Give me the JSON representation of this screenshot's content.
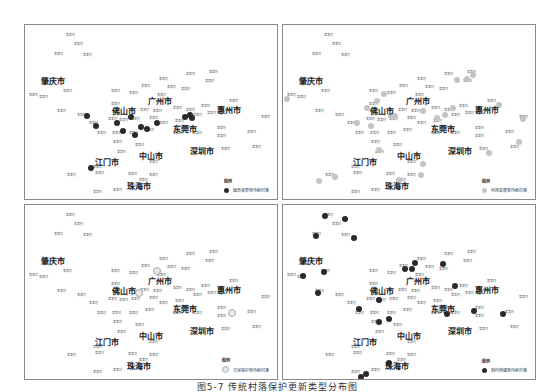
{
  "caption": "图5-7 传统村落保护更新类型分布图",
  "cities": [
    {
      "name": "肇庆市",
      "x": 28,
      "y": 55
    },
    {
      "name": "广州市",
      "x": 135,
      "y": 75
    },
    {
      "name": "佛山市",
      "x": 99,
      "y": 85
    },
    {
      "name": "惠州市",
      "x": 204,
      "y": 84
    },
    {
      "name": "东莞市",
      "x": 160,
      "y": 103
    },
    {
      "name": "深圳市",
      "x": 177,
      "y": 125
    },
    {
      "name": "中山市",
      "x": 126,
      "y": 130
    },
    {
      "name": "江门市",
      "x": 82,
      "y": 136
    },
    {
      "name": "珠海市",
      "x": 114,
      "y": 160
    }
  ],
  "villages": [
    {
      "name": "某某村",
      "x": 45,
      "y": 10
    },
    {
      "name": "某某村",
      "x": 53,
      "y": 19
    },
    {
      "name": "某某村",
      "x": 33,
      "y": 29
    },
    {
      "name": "某某村",
      "x": 62,
      "y": 30
    },
    {
      "name": "某某村",
      "x": 8,
      "y": 70
    },
    {
      "name": "某某村",
      "x": 18,
      "y": 72
    },
    {
      "name": "某某村",
      "x": 42,
      "y": 66
    },
    {
      "name": "某某村",
      "x": 90,
      "y": 66
    },
    {
      "name": "某某村",
      "x": 108,
      "y": 68
    },
    {
      "name": "某某村",
      "x": 120,
      "y": 61
    },
    {
      "name": "某某村",
      "x": 138,
      "y": 54
    },
    {
      "name": "某某村",
      "x": 146,
      "y": 62
    },
    {
      "name": "某某村",
      "x": 160,
      "y": 64
    },
    {
      "name": "某某村",
      "x": 165,
      "y": 49
    },
    {
      "name": "某某村",
      "x": 188,
      "y": 47
    },
    {
      "name": "某某村",
      "x": 184,
      "y": 56
    },
    {
      "name": "某某村",
      "x": 136,
      "y": 70
    },
    {
      "name": "某某村",
      "x": 90,
      "y": 79
    },
    {
      "name": "某某村",
      "x": 36,
      "y": 86
    },
    {
      "name": "某某村",
      "x": 56,
      "y": 90
    },
    {
      "name": "某某村",
      "x": 119,
      "y": 85
    },
    {
      "name": "某某村",
      "x": 132,
      "y": 86
    },
    {
      "name": "某某村",
      "x": 152,
      "y": 83
    },
    {
      "name": "某某村",
      "x": 165,
      "y": 85
    },
    {
      "name": "某某村",
      "x": 172,
      "y": 90
    },
    {
      "name": "某某村",
      "x": 180,
      "y": 81
    },
    {
      "name": "某某村",
      "x": 186,
      "y": 88
    },
    {
      "name": "某某村",
      "x": 208,
      "y": 76
    },
    {
      "name": "某某村",
      "x": 240,
      "y": 92
    },
    {
      "name": "某某村",
      "x": 68,
      "y": 98
    },
    {
      "name": "某某村",
      "x": 87,
      "y": 94
    },
    {
      "name": "某某村",
      "x": 98,
      "y": 95
    },
    {
      "name": "某某村",
      "x": 110,
      "y": 94
    },
    {
      "name": "某某村",
      "x": 128,
      "y": 93
    },
    {
      "name": "某某村",
      "x": 138,
      "y": 98
    },
    {
      "name": "某某村",
      "x": 154,
      "y": 96
    },
    {
      "name": "某某村",
      "x": 196,
      "y": 103
    },
    {
      "name": "某某村",
      "x": 226,
      "y": 107
    },
    {
      "name": "某某村",
      "x": 76,
      "y": 108
    },
    {
      "name": "某某村",
      "x": 91,
      "y": 108
    },
    {
      "name": "某某村",
      "x": 108,
      "y": 108
    },
    {
      "name": "某某村",
      "x": 124,
      "y": 105
    },
    {
      "name": "某某村",
      "x": 152,
      "y": 108
    },
    {
      "name": "某某村",
      "x": 172,
      "y": 108
    },
    {
      "name": "某某村",
      "x": 196,
      "y": 111
    },
    {
      "name": "某某村",
      "x": 92,
      "y": 117
    },
    {
      "name": "某某村",
      "x": 114,
      "y": 120
    },
    {
      "name": "某某村",
      "x": 96,
      "y": 127
    },
    {
      "name": "某某村",
      "x": 200,
      "y": 124
    },
    {
      "name": "某某村",
      "x": 231,
      "y": 122
    },
    {
      "name": "某某村",
      "x": 128,
      "y": 137
    },
    {
      "name": "某某村",
      "x": 72,
      "y": 142
    },
    {
      "name": "某某村",
      "x": 74,
      "y": 148
    },
    {
      "name": "某某村",
      "x": 46,
      "y": 150
    },
    {
      "name": "某某村",
      "x": 107,
      "y": 149
    },
    {
      "name": "某某村",
      "x": 128,
      "y": 150
    },
    {
      "name": "某某村",
      "x": 118,
      "y": 155
    },
    {
      "name": "某某村",
      "x": 92,
      "y": 165
    },
    {
      "name": "某某村",
      "x": 72,
      "y": 167
    }
  ],
  "panels": [
    {
      "id": "integrated-protection",
      "left": 24,
      "top": 24,
      "legend_title": "图例",
      "legend_label": "融合保育型传统村落",
      "dot_color": "#2a2a2a",
      "dots": [
        {
          "x": 62,
          "y": 91
        },
        {
          "x": 71,
          "y": 101
        },
        {
          "x": 92,
          "y": 98
        },
        {
          "x": 106,
          "y": 92
        },
        {
          "x": 98,
          "y": 106
        },
        {
          "x": 110,
          "y": 110
        },
        {
          "x": 116,
          "y": 102
        },
        {
          "x": 122,
          "y": 104
        },
        {
          "x": 132,
          "y": 98
        },
        {
          "x": 160,
          "y": 92
        },
        {
          "x": 165,
          "y": 90
        },
        {
          "x": 167,
          "y": 93
        },
        {
          "x": 66,
          "y": 143
        }
      ]
    },
    {
      "id": "development",
      "left": 282,
      "top": 24,
      "legend_title": "图例",
      "legend_label": "利用发展型传统村落",
      "dot_color": "#c4c4c4",
      "dots": [
        {
          "x": 4,
          "y": 74
        },
        {
          "x": 101,
          "y": 69
        },
        {
          "x": 94,
          "y": 76
        },
        {
          "x": 84,
          "y": 83
        },
        {
          "x": 108,
          "y": 91
        },
        {
          "x": 112,
          "y": 91
        },
        {
          "x": 74,
          "y": 98
        },
        {
          "x": 88,
          "y": 101
        },
        {
          "x": 140,
          "y": 86
        },
        {
          "x": 154,
          "y": 93
        },
        {
          "x": 162,
          "y": 90
        },
        {
          "x": 170,
          "y": 83
        },
        {
          "x": 174,
          "y": 55
        },
        {
          "x": 184,
          "y": 54
        },
        {
          "x": 190,
          "y": 50
        },
        {
          "x": 216,
          "y": 80
        },
        {
          "x": 240,
          "y": 94
        },
        {
          "x": 236,
          "y": 117
        },
        {
          "x": 206,
          "y": 128
        },
        {
          "x": 96,
          "y": 125
        },
        {
          "x": 140,
          "y": 139
        },
        {
          "x": 138,
          "y": 150
        },
        {
          "x": 116,
          "y": 155
        },
        {
          "x": 52,
          "y": 152
        },
        {
          "x": 36,
          "y": 156
        }
      ]
    },
    {
      "id": "routine-protection",
      "left": 24,
      "top": 204,
      "legend_title": "图例",
      "legend_label": "日常保护型传统村落",
      "dot_color": "#e8e8e8",
      "dots": [
        {
          "x": 132,
          "y": 66
        },
        {
          "x": 114,
          "y": 88
        },
        {
          "x": 207,
          "y": 108
        }
      ]
    },
    {
      "id": "restricted-repair",
      "left": 282,
      "top": 204,
      "legend_title": "图例",
      "legend_label": "制约修缮型传统村落",
      "dot_color": "#2a2a2a",
      "dots": [
        {
          "x": 42,
          "y": 11
        },
        {
          "x": 62,
          "y": 14
        },
        {
          "x": 33,
          "y": 31
        },
        {
          "x": 71,
          "y": 33
        },
        {
          "x": 20,
          "y": 71
        },
        {
          "x": 41,
          "y": 67
        },
        {
          "x": 35,
          "y": 88
        },
        {
          "x": 132,
          "y": 58
        },
        {
          "x": 129,
          "y": 64
        },
        {
          "x": 122,
          "y": 64
        },
        {
          "x": 160,
          "y": 59
        },
        {
          "x": 172,
          "y": 81
        },
        {
          "x": 96,
          "y": 95
        },
        {
          "x": 76,
          "y": 104
        },
        {
          "x": 106,
          "y": 114
        },
        {
          "x": 96,
          "y": 117
        },
        {
          "x": 164,
          "y": 109
        },
        {
          "x": 191,
          "y": 106
        },
        {
          "x": 220,
          "y": 109
        },
        {
          "x": 106,
          "y": 158
        },
        {
          "x": 78,
          "y": 172
        },
        {
          "x": 83,
          "y": 169
        }
      ]
    }
  ]
}
